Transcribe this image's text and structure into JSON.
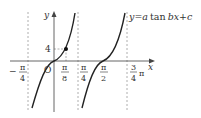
{
  "figure": {
    "type": "function-graph",
    "equation_label": "y = a tan bx + c",
    "equation_parts": {
      "y": "y",
      "eq": "=",
      "a": "a",
      "tan": "tan",
      "b": "b",
      "x": "x",
      "plus": "+",
      "c": "c"
    },
    "axes": {
      "x_label": "x",
      "y_label": "y",
      "origin_label": "O"
    },
    "x_ticks": [
      {
        "num": "π",
        "den": "4",
        "sign": "−",
        "pos": "-pi/4"
      },
      {
        "num": "π",
        "den": "8",
        "sign": "",
        "pos": "pi/8"
      },
      {
        "num": "π",
        "den": "4",
        "sign": "",
        "pos": "pi/4"
      },
      {
        "num": "π",
        "den": "2",
        "sign": "",
        "pos": "pi/2"
      },
      {
        "num": "3",
        "den": "4",
        "suffix": "π",
        "sign": "",
        "pos": "3pi/4"
      }
    ],
    "y_ticks": [
      {
        "label": "4",
        "pos": 4
      }
    ],
    "marked_point": {
      "x": "π/8",
      "y": "4"
    },
    "asymptotes": [
      "-π/4",
      "π/4",
      "3π/4"
    ],
    "colors": {
      "curve": "#222222",
      "axis": "#444444",
      "dashed": "#999999"
    }
  }
}
